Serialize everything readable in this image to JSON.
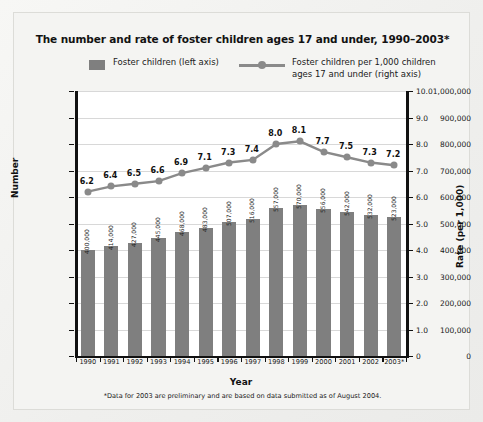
{
  "title": "The number and rate of foster children ages 17 and under, 1990–2003*",
  "legend": {
    "bar_label": "Foster children (left axis)",
    "line_label_1": "Foster children per 1,000 children",
    "line_label_2": "ages 17 and under (right axis)",
    "bar_swatch_name": "bar-legend-swatch",
    "line_swatch_name": "line-legend-marker"
  },
  "footnote": "*Data for 2003 are preliminary and are based on data submitted as of August 2004.",
  "colors": {
    "bar": "#7f7f7f",
    "line": "#8a8a8a",
    "axis": "#111111",
    "grid": "#d8d8d8",
    "plot_bg": "#ffffff",
    "panel_bg": "#f4f4f2"
  },
  "chart_data": {
    "type": "bar",
    "title": "The number and rate of foster children ages 17 and under, 1990–2003*",
    "xlabel": "Year",
    "ylabel": "Number",
    "y2label": "Rate (per 1,000)",
    "grid": true,
    "legend_position": "top",
    "categories": [
      "1990",
      "1991",
      "1992",
      "1993",
      "1994",
      "1995",
      "1996",
      "1997",
      "1998",
      "1999",
      "2000",
      "2001",
      "2002",
      "2003*"
    ],
    "ylim": [
      0,
      1000000
    ],
    "yticks": [
      "0",
      "100,000",
      "200,000",
      "300,000",
      "400,000",
      "500,000",
      "600,000",
      "700,000",
      "800,000",
      "900,000",
      "1,000,000"
    ],
    "y2lim": [
      0,
      10.0
    ],
    "y2ticks": [
      "0",
      "1.0",
      "2.0",
      "3.0",
      "4.0",
      "5.0",
      "6.0",
      "7.0",
      "8.0",
      "9.0",
      "10.0"
    ],
    "series": [
      {
        "name": "Foster children (left axis)",
        "type": "bar",
        "axis": "left",
        "values": [
          400000,
          414000,
          427000,
          445000,
          468000,
          483000,
          507000,
          516000,
          557000,
          570000,
          556000,
          542000,
          532000,
          523000
        ],
        "labels": [
          "400,000",
          "414,000",
          "427,000",
          "445,000",
          "468,000",
          "483,000",
          "507,000",
          "516,000",
          "557,000",
          "570,000",
          "556,000",
          "542,000",
          "532,000",
          "523,000"
        ]
      },
      {
        "name": "Foster children per 1,000 children ages 17 and under (right axis)",
        "type": "line",
        "axis": "right",
        "values": [
          6.2,
          6.4,
          6.5,
          6.6,
          6.9,
          7.1,
          7.3,
          7.4,
          8.0,
          8.1,
          7.7,
          7.5,
          7.3,
          7.2
        ],
        "labels": [
          "6.2",
          "6.4",
          "6.5",
          "6.6",
          "6.9",
          "7.1",
          "7.3",
          "7.4",
          "8.0",
          "8.1",
          "7.7",
          "7.5",
          "7.3",
          "7.2"
        ]
      }
    ]
  }
}
